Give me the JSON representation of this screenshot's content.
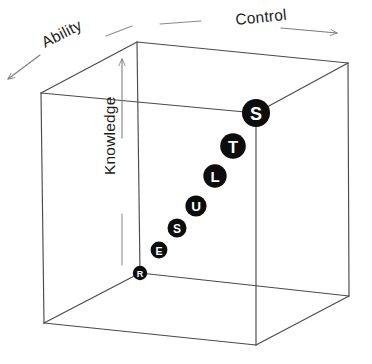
{
  "figure": {
    "background_color": "#ffffff",
    "edge_color": "#4a4a4a",
    "node_fill_color": "#0d0d0d",
    "node_text_color": "#ffffff",
    "guide_color": "#8a8a8a"
  },
  "axes": [
    {
      "id": "control",
      "label": "Control",
      "direction": "right",
      "label_x": 236,
      "label_y": 25,
      "rotation": -6,
      "lead_line": {
        "x1": 160,
        "y1": 24,
        "x2": 201,
        "y2": 21
      },
      "arrow_line": {
        "x1": 281,
        "y1": 28,
        "x2": 337,
        "y2": 33
      }
    },
    {
      "id": "ability",
      "label": "Ability",
      "direction": "left-down",
      "label_x": 45,
      "label_y": 48,
      "rotation": -27,
      "lead_line": {
        "x1": 106,
        "y1": 36,
        "x2": 132,
        "y2": 26
      },
      "arrow_line": {
        "x1": 40,
        "y1": 55,
        "x2": 8,
        "y2": 79
      }
    },
    {
      "id": "knowledge",
      "label": "Knowledge",
      "direction": "up",
      "label_x": 115,
      "label_y": 175,
      "rotation": -90,
      "lead_line": {
        "x1": 122,
        "y1": 265,
        "x2": 122,
        "y2": 214
      },
      "arrow_line": {
        "x1": 122,
        "y1": 138,
        "x2": 122,
        "y2": 59
      }
    }
  ],
  "cube": {
    "vertices": {
      "front_top_left": [
        137,
        42
      ],
      "front_top_right": [
        348,
        63
      ],
      "front_bottom_left": [
        140,
        273
      ],
      "front_bottom_right": [
        349,
        296
      ],
      "back_top_left": [
        41,
        93
      ],
      "back_top_right": [
        256,
        113
      ],
      "back_bottom_left": [
        44,
        323
      ],
      "back_bottom_right": [
        256,
        345
      ]
    },
    "edges": [
      [
        "front_top_left",
        "front_top_right"
      ],
      [
        "front_top_right",
        "front_bottom_right"
      ],
      [
        "front_bottom_right",
        "front_bottom_left"
      ],
      [
        "front_bottom_left",
        "front_top_left"
      ],
      [
        "back_top_left",
        "back_top_right"
      ],
      [
        "back_top_right",
        "back_bottom_right"
      ],
      [
        "back_bottom_right",
        "back_bottom_left"
      ],
      [
        "back_bottom_left",
        "back_top_left"
      ],
      [
        "front_top_left",
        "back_top_left"
      ],
      [
        "front_top_right",
        "back_top_right"
      ],
      [
        "front_bottom_left",
        "back_bottom_left"
      ],
      [
        "front_bottom_right",
        "back_bottom_right"
      ]
    ]
  },
  "nodes": [
    {
      "id": "node-r",
      "letter": "R",
      "cx": 140,
      "cy": 273,
      "r": 7.2,
      "font_size": 9
    },
    {
      "id": "node-e",
      "letter": "E",
      "cx": 159,
      "cy": 250,
      "r": 8.4,
      "font_size": 10.5
    },
    {
      "id": "node-s1",
      "letter": "S",
      "cx": 177,
      "cy": 228,
      "r": 9.5,
      "font_size": 12
    },
    {
      "id": "node-u",
      "letter": "U",
      "cx": 196,
      "cy": 206,
      "r": 10.6,
      "font_size": 13.5
    },
    {
      "id": "node-l",
      "letter": "L",
      "cx": 215,
      "cy": 176,
      "r": 11.7,
      "font_size": 15
    },
    {
      "id": "node-t",
      "letter": "T",
      "cx": 233,
      "cy": 146,
      "r": 12.8,
      "font_size": 16.5
    },
    {
      "id": "node-s2",
      "letter": "S",
      "cx": 256,
      "cy": 113,
      "r": 14.0,
      "font_size": 18
    }
  ],
  "chart_data": {
    "type": "scatter",
    "xlabel": "Control",
    "ylabel": "Knowledge",
    "zlabel": "Ability",
    "axis_labels": [
      "Control",
      "Ability",
      "Knowledge"
    ],
    "categories": [
      "R",
      "E",
      "S",
      "U",
      "L",
      "T",
      "S"
    ],
    "series": [
      {
        "name": "RESULTS progression",
        "values": [
          {
            "label": "R",
            "x": 0.0,
            "y": 0.0,
            "size": 7.2
          },
          {
            "label": "E",
            "x": 0.09,
            "y": 0.1,
            "size": 8.4
          },
          {
            "label": "S",
            "x": 0.18,
            "y": 0.19,
            "size": 9.5
          },
          {
            "label": "U",
            "x": 0.27,
            "y": 0.29,
            "size": 10.6
          },
          {
            "label": "L",
            "x": 0.36,
            "y": 0.42,
            "size": 11.7
          },
          {
            "label": "T",
            "x": 0.45,
            "y": 0.55,
            "size": 12.8
          },
          {
            "label": "S",
            "x": 0.55,
            "y": 0.69,
            "size": 14.0
          }
        ]
      }
    ],
    "grid": false,
    "legend": "none",
    "annotation": "Circles spell RESULTS and grow in size along the diagonal from the origin corner"
  }
}
